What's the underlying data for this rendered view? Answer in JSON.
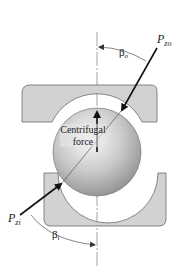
{
  "diagram": {
    "labels": {
      "p_zo": "P",
      "p_zo_sub": "zo",
      "p_zi": "P",
      "p_zi_sub": "zi",
      "beta_o": "β",
      "beta_o_sub": "o",
      "beta_i": "β",
      "beta_i_sub": "i",
      "centrifugal_line1": "Centrifugal",
      "centrifugal_line2": "force"
    },
    "colors": {
      "race_fill": "#d2d2d2",
      "race_stroke": "#6a6a6a",
      "ball_light": "#f4f4f4",
      "ball_dark": "#9a9a9a",
      "arrow": "#111111",
      "centerline": "#555555"
    }
  }
}
